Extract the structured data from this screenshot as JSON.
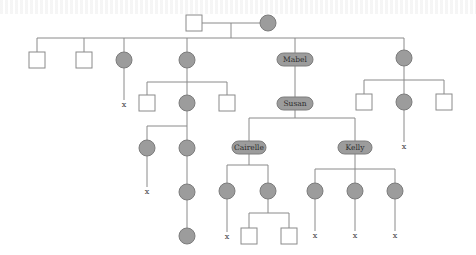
{
  "diagram": {
    "type": "family-tree-pedigree",
    "named_individuals": [
      {
        "id": "mabel",
        "label": "Mabel",
        "shape": "pill"
      },
      {
        "id": "susan",
        "label": "Susan",
        "shape": "pill"
      },
      {
        "id": "cairelle",
        "label": "Cairelle",
        "shape": "pill"
      },
      {
        "id": "kelly",
        "label": "Kelly",
        "shape": "pill"
      }
    ],
    "deceased_marker": "x",
    "legend_shapes": {
      "square": "male",
      "circle_filled": "female",
      "pill_filled": "named female"
    }
  },
  "nodes": [
    {
      "id": "g0m",
      "shape": "square",
      "x": 194,
      "y": 23
    },
    {
      "id": "g0f",
      "shape": "circle",
      "x": 268,
      "y": 23
    },
    {
      "id": "c1",
      "shape": "square",
      "x": 37,
      "y": 60
    },
    {
      "id": "c2",
      "shape": "square",
      "x": 84,
      "y": 60
    },
    {
      "id": "c3",
      "shape": "circle",
      "x": 124,
      "y": 60
    },
    {
      "id": "c4",
      "shape": "circle",
      "x": 187,
      "y": 60
    },
    {
      "id": "mabel",
      "shape": "pill",
      "x": 295,
      "y": 59,
      "label_ref": "diagram.named_individuals.0.label"
    },
    {
      "id": "c6",
      "shape": "circle",
      "x": 404,
      "y": 58
    },
    {
      "id": "c4a",
      "shape": "square",
      "x": 147,
      "y": 103
    },
    {
      "id": "c4b",
      "shape": "circle",
      "x": 187,
      "y": 103
    },
    {
      "id": "c4c",
      "shape": "square",
      "x": 227,
      "y": 103
    },
    {
      "id": "c4b1",
      "shape": "circle",
      "x": 147,
      "y": 148
    },
    {
      "id": "c4b2",
      "shape": "circle",
      "x": 187,
      "y": 148
    },
    {
      "id": "c4b2a",
      "shape": "circle",
      "x": 187,
      "y": 192
    },
    {
      "id": "c4b2b",
      "shape": "circle",
      "x": 187,
      "y": 236
    },
    {
      "id": "susan",
      "shape": "pill",
      "x": 295,
      "y": 103,
      "label_ref": "diagram.named_individuals.1.label"
    },
    {
      "id": "c6a",
      "shape": "square",
      "x": 364,
      "y": 102
    },
    {
      "id": "c6b",
      "shape": "circle",
      "x": 404,
      "y": 102
    },
    {
      "id": "c6c",
      "shape": "square",
      "x": 444,
      "y": 102
    },
    {
      "id": "cairelle",
      "shape": "pill",
      "x": 249,
      "y": 147,
      "label_ref": "diagram.named_individuals.2.label"
    },
    {
      "id": "kelly",
      "shape": "pill",
      "x": 355,
      "y": 147,
      "label_ref": "diagram.named_individuals.3.label"
    },
    {
      "id": "ca1",
      "shape": "circle",
      "x": 227,
      "y": 191
    },
    {
      "id": "ca2",
      "shape": "circle",
      "x": 268,
      "y": 191
    },
    {
      "id": "ca2a",
      "shape": "square",
      "x": 249,
      "y": 236
    },
    {
      "id": "ca2b",
      "shape": "square",
      "x": 289,
      "y": 236
    },
    {
      "id": "k1",
      "shape": "circle",
      "x": 315,
      "y": 191
    },
    {
      "id": "k2",
      "shape": "circle",
      "x": 355,
      "y": 191
    },
    {
      "id": "k3",
      "shape": "circle",
      "x": 395,
      "y": 191
    }
  ],
  "x_marks": [
    {
      "x": 124,
      "y": 104
    },
    {
      "x": 147,
      "y": 191
    },
    {
      "x": 404,
      "y": 146
    },
    {
      "x": 227,
      "y": 236
    },
    {
      "x": 315,
      "y": 236
    },
    {
      "x": 355,
      "y": 236
    },
    {
      "x": 395,
      "y": 236
    }
  ]
}
